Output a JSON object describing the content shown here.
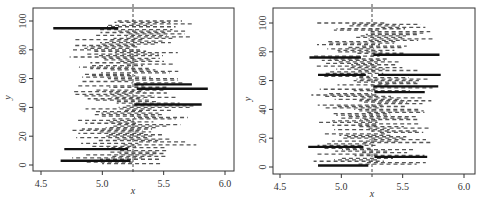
{
  "chart_data": [
    {
      "type": "line",
      "title": "",
      "xlabel": "x",
      "ylabel": "y",
      "xlim": [
        4.45,
        6.05
      ],
      "ylim": [
        -3,
        108
      ],
      "xticks": [
        "4.5",
        "5.0",
        "5.5",
        "6.0"
      ],
      "yticks": [
        "0",
        "20",
        "40",
        "60",
        "80",
        "100"
      ],
      "reference_line_x": 5.25,
      "grid": false,
      "description": "100 horizontal interval segments (y = 1..100); most drawn dashed grey, intervals missing the true value x=5.25 drawn thick black",
      "highlighted_intervals": [
        {
          "y": 95,
          "x_low": 4.6,
          "x_high": 5.13
        },
        {
          "y": 56,
          "x_low": 5.26,
          "x_high": 5.73
        },
        {
          "y": 53,
          "x_low": 5.28,
          "x_high": 5.86
        },
        {
          "y": 42,
          "x_low": 5.26,
          "x_high": 5.81
        },
        {
          "y": 11,
          "x_low": 4.69,
          "x_high": 5.21
        },
        {
          "y": 3,
          "x_low": 4.66,
          "x_high": 5.23
        }
      ]
    },
    {
      "type": "line",
      "title": "",
      "xlabel": "x",
      "ylabel": "y",
      "xlim": [
        4.45,
        6.05
      ],
      "ylim": [
        -3,
        108
      ],
      "xticks": [
        "4.5",
        "5.0",
        "5.5",
        "6.0"
      ],
      "yticks": [
        "0",
        "20",
        "40",
        "60",
        "80",
        "100"
      ],
      "reference_line_x": 5.25,
      "grid": false,
      "description": "100 horizontal interval segments (y = 1..100); most drawn dashed grey, intervals missing the true value x=5.25 drawn thick black",
      "highlighted_intervals": [
        {
          "y": 78,
          "x_low": 5.26,
          "x_high": 5.8
        },
        {
          "y": 76,
          "x_low": 4.74,
          "x_high": 5.16
        },
        {
          "y": 64,
          "x_low": 4.81,
          "x_high": 5.2
        },
        {
          "y": 64,
          "x_low": 5.3,
          "x_high": 5.81
        },
        {
          "y": 56,
          "x_low": 5.26,
          "x_high": 5.79
        },
        {
          "y": 52,
          "x_low": 5.27,
          "x_high": 5.68
        },
        {
          "y": 14,
          "x_low": 4.73,
          "x_high": 5.18
        },
        {
          "y": 7,
          "x_low": 5.27,
          "x_high": 5.7
        },
        {
          "y": 1,
          "x_low": 4.81,
          "x_high": 5.22
        }
      ]
    }
  ],
  "panels": [
    {
      "xlabel": "x",
      "ylabel": "y",
      "xticks": [
        "4.5",
        "5.0",
        "5.5",
        "6.0"
      ],
      "yticks": [
        "0",
        "20",
        "40",
        "60",
        "80",
        "100"
      ]
    },
    {
      "xlabel": "x",
      "ylabel": "y",
      "xticks": [
        "4.5",
        "5.0",
        "5.5",
        "6.0"
      ],
      "yticks": [
        "0",
        "20",
        "40",
        "60",
        "80",
        "100"
      ]
    }
  ]
}
